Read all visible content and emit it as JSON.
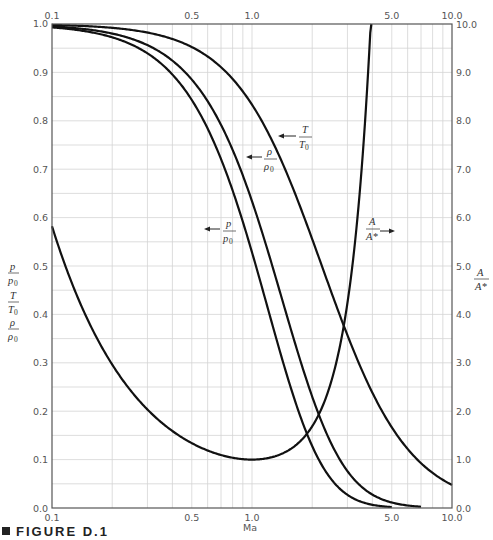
{
  "chart_data": {
    "type": "line",
    "title": "",
    "caption": "FIGURE D.1",
    "xlabel": "Ma",
    "xscale": "log",
    "xlim": [
      0.1,
      10.0
    ],
    "x_ticks_top": [
      "0.1",
      "0.5",
      "1.0",
      "5.0",
      "10.0"
    ],
    "x_ticks_bottom": [
      "0.1",
      "0.5",
      "1.0",
      "5.0",
      "10.0"
    ],
    "ylabel_left": [
      "p/p0",
      "T/T0",
      "ρ/ρ0"
    ],
    "ylim_left": [
      0.0,
      1.0
    ],
    "y_ticks_left": [
      "0.0",
      "0.1",
      "0.2",
      "0.3",
      "0.4",
      "0.5",
      "0.6",
      "0.7",
      "0.8",
      "0.9",
      "1.0"
    ],
    "ylabel_right": "A/A*",
    "ylim_right": [
      0.0,
      10.0
    ],
    "y_ticks_right": [
      "0.0",
      "1.0",
      "2.0",
      "3.0",
      "4.0",
      "5.0",
      "6.0",
      "7.0",
      "8.0",
      "9.0",
      "10.0"
    ],
    "grid": true,
    "gamma": 1.4,
    "series": [
      {
        "name": "T/T0",
        "axis": "left",
        "label": "T/T0",
        "x": [
          0.1,
          0.2,
          0.3,
          0.5,
          0.7,
          1.0,
          1.5,
          2.0,
          3.0,
          4.0,
          5.0,
          7.0,
          10.0
        ],
        "values": [
          0.998,
          0.992,
          0.982,
          0.952,
          0.911,
          0.833,
          0.69,
          0.556,
          0.357,
          0.238,
          0.167,
          0.093,
          0.048
        ]
      },
      {
        "name": "ρ/ρ0",
        "axis": "left",
        "label": "ρ/ρ0",
        "x": [
          0.1,
          0.2,
          0.3,
          0.5,
          0.7,
          1.0,
          1.5,
          2.0,
          3.0,
          4.0,
          5.0,
          7.0
        ],
        "values": [
          0.995,
          0.98,
          0.956,
          0.885,
          0.792,
          0.634,
          0.395,
          0.23,
          0.076,
          0.028,
          0.011,
          0.002
        ]
      },
      {
        "name": "p/p0",
        "axis": "left",
        "label": "p/p0",
        "x": [
          0.1,
          0.2,
          0.3,
          0.5,
          0.7,
          1.0,
          1.5,
          2.0,
          3.0,
          4.0,
          5.0
        ],
        "values": [
          0.993,
          0.973,
          0.939,
          0.843,
          0.721,
          0.528,
          0.272,
          0.128,
          0.027,
          0.007,
          0.002
        ]
      },
      {
        "name": "A/A*",
        "axis": "right",
        "label": "A/A*",
        "x": [
          0.1,
          0.2,
          0.3,
          0.5,
          0.7,
          1.0,
          1.5,
          2.0,
          3.0,
          4.0
        ],
        "values": [
          5.82,
          2.96,
          2.04,
          1.34,
          1.09,
          1.0,
          1.18,
          1.69,
          4.23,
          10.7
        ]
      }
    ]
  },
  "labels": {
    "left_axis": {
      "p": "p",
      "p0": "p",
      "T": "T",
      "T0": "T",
      "rho": "ρ",
      "rho0": "ρ",
      "sub": "0"
    },
    "curve_T": {
      "num": "T",
      "den": "T",
      "sub": "0",
      "arrow": "←"
    },
    "curve_rho": {
      "num": "ρ",
      "den": "ρ",
      "sub": "0",
      "arrow": "←"
    },
    "curve_p": {
      "num": "p",
      "den": "p",
      "sub": "0",
      "arrow": "←"
    },
    "curve_A": {
      "num": "A",
      "den": "A*",
      "arrow": "→"
    },
    "right_axis": {
      "num": "A",
      "den": "A*"
    }
  },
  "caption": {
    "text": "FIGURE D.1"
  }
}
